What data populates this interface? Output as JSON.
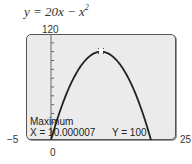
{
  "equation": {
    "lhs": "y = 20x − x",
    "exponent": "2"
  },
  "axes": {
    "ymax_label": "120",
    "xmin_label": "−5",
    "xmax_label": "25",
    "xzero_label": "0"
  },
  "readout": {
    "title": "Maximum",
    "x_text": "X = 10.000007",
    "y_text": "Y = 100"
  },
  "chart_data": {
    "type": "line",
    "function": "20x - x^2",
    "xlim": [
      -5,
      25
    ],
    "ylim": [
      0,
      120
    ],
    "x": [
      0,
      2,
      4,
      6,
      8,
      10,
      12,
      14,
      16,
      18,
      20
    ],
    "series": [
      {
        "name": "y = 20x − x²",
        "values": [
          0,
          36,
          64,
          84,
          96,
          100,
          96,
          84,
          64,
          36,
          0
        ]
      }
    ],
    "annotations": [
      {
        "text": "Maximum",
        "x": 10.000007,
        "y": 100
      }
    ],
    "yticks_interval": 10,
    "grid": false
  }
}
